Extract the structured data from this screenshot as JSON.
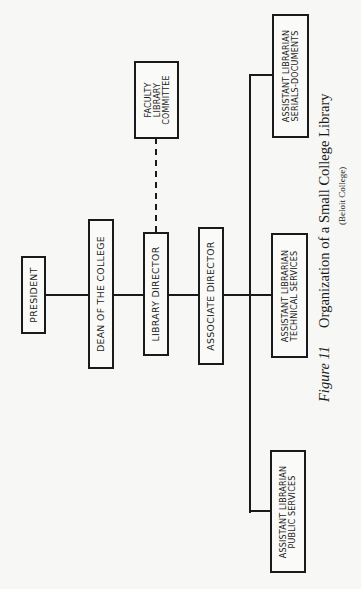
{
  "chart": {
    "nodes": {
      "president": {
        "lines": [
          "PRESIDENT"
        ]
      },
      "dean": {
        "lines": [
          "DEAN OF THE COLLEGE"
        ]
      },
      "library_director": {
        "lines": [
          "LIBRARY DIRECTOR"
        ]
      },
      "faculty_committee": {
        "lines": [
          "FACULTY",
          "LIBRARY",
          "COMMITTEE"
        ]
      },
      "associate_director": {
        "lines": [
          "ASSOCIATE DIRECTOR"
        ]
      },
      "asst_serials": {
        "lines": [
          "ASSISTANT LIBRARIAN",
          "SERIALS-DOCUMENTS"
        ]
      },
      "asst_technical": {
        "lines": [
          "ASSISTANT LIBRARIAN",
          "TECHNICAL SERVICES"
        ]
      },
      "asst_public": {
        "lines": [
          "ASSISTANT LIBRARIAN",
          "PUBLIC SERVICES"
        ]
      }
    },
    "edges": [
      {
        "from": "president",
        "to": "dean",
        "style": "solid"
      },
      {
        "from": "dean",
        "to": "library_director",
        "style": "solid"
      },
      {
        "from": "library_director",
        "to": "faculty_committee",
        "style": "dashed"
      },
      {
        "from": "library_director",
        "to": "associate_director",
        "style": "solid"
      },
      {
        "from": "associate_director",
        "to": "asst_serials",
        "style": "solid"
      },
      {
        "from": "associate_director",
        "to": "asst_technical",
        "style": "solid"
      },
      {
        "from": "associate_director",
        "to": "asst_public",
        "style": "solid"
      }
    ],
    "orientation": "rotated -90deg (page printed sideways)"
  },
  "caption": {
    "figure_label": "Figure 11",
    "title": "Organization of a Small College Library",
    "subtitle": "(Beloit College)"
  }
}
